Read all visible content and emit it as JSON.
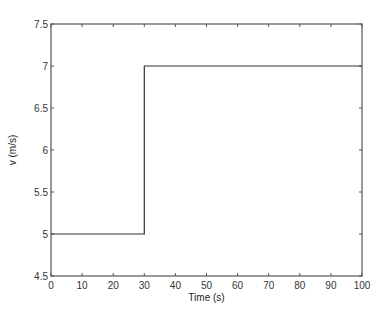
{
  "chart_data": {
    "type": "line",
    "title": "",
    "xlabel": "Time (s)",
    "ylabel": "v  (m/s)",
    "xlim": [
      0,
      100
    ],
    "ylim": [
      4.5,
      7.5
    ],
    "xticks": [
      0,
      10,
      20,
      30,
      40,
      50,
      60,
      70,
      80,
      90,
      100
    ],
    "yticks": [
      4.5,
      5,
      5.5,
      6,
      6.5,
      7,
      7.5
    ],
    "xtick_labels": [
      "0",
      "10",
      "20",
      "30",
      "40",
      "50",
      "60",
      "70",
      "80",
      "90",
      "100"
    ],
    "ytick_labels": [
      "4.5",
      "5",
      "5.5",
      "6",
      "6.5",
      "7",
      "7.5"
    ],
    "grid": false,
    "legend": null,
    "series": [
      {
        "name": "v",
        "color": "#333333",
        "x": [
          0,
          30,
          30,
          100
        ],
        "y": [
          5,
          5,
          7,
          7
        ]
      }
    ]
  },
  "layout": {
    "plot_left": 51,
    "plot_top": 24,
    "plot_right": 362,
    "plot_bottom": 276,
    "axis_color": "#555555",
    "line_color": "#333333"
  }
}
